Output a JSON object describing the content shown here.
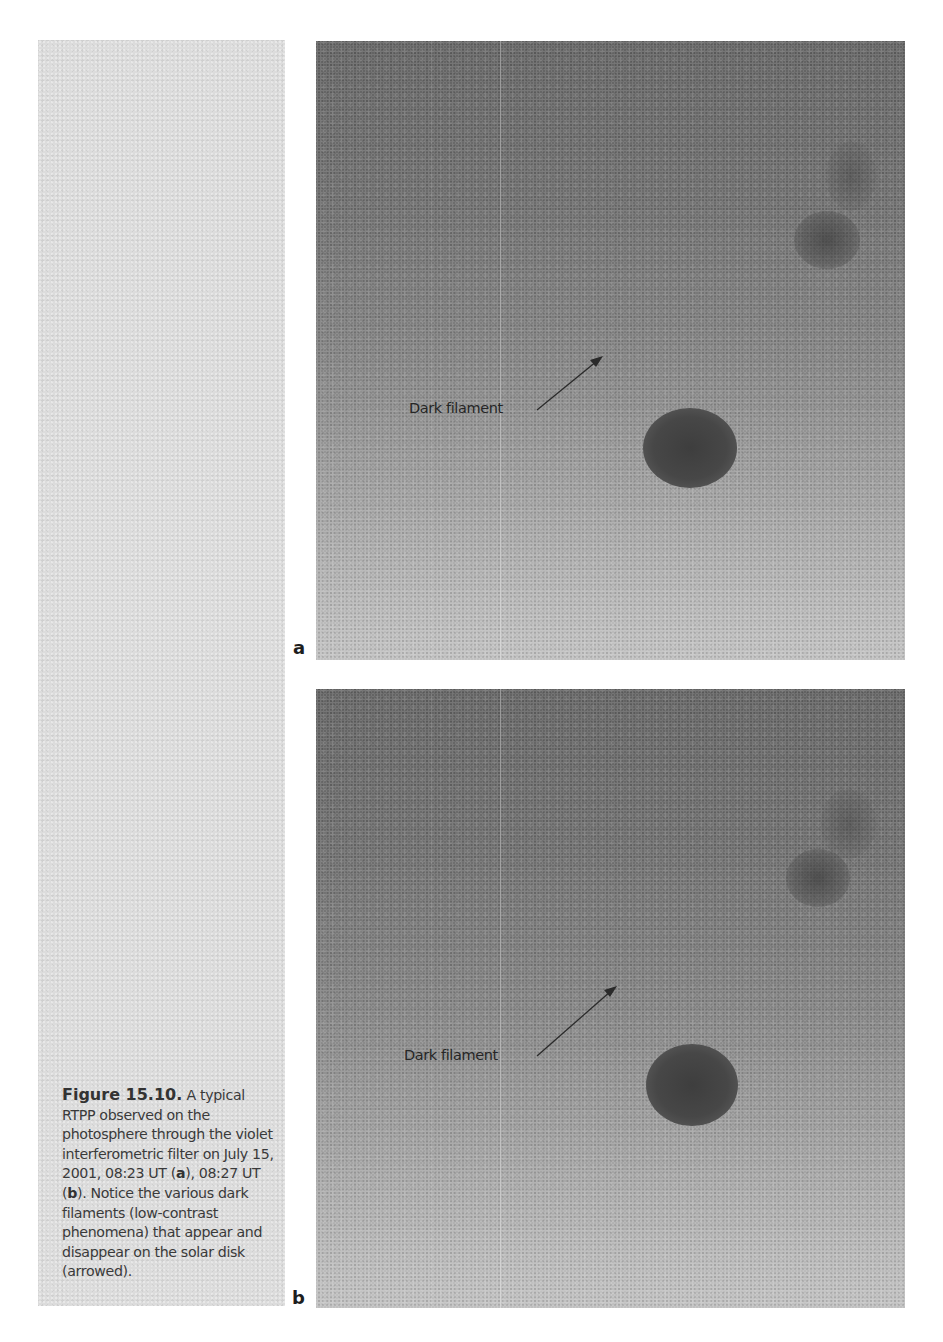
{
  "caption": {
    "figure_label": "Figure 15.10.",
    "lead": " A typical RTPP observed on the photosphere through the violet interferometric filter on July 15, 2001, 08:23 UT (",
    "panel_a_ref": "a",
    "mid": "), 08:27 UT (",
    "panel_b_ref": "b",
    "tail": "). Notice the various dark filaments (low-contrast phenomena) that appear and disappear on the solar disk (arrowed)."
  },
  "panels": [
    {
      "letter": "a",
      "time": "08:23 UT",
      "annotation": "Dark filament"
    },
    {
      "letter": "b",
      "time": "08:27 UT",
      "annotation": "Dark filament"
    }
  ],
  "colors": {
    "page_background": "#ffffff",
    "caption_panel": "#dcdcdc",
    "photo_top": "#606060",
    "photo_bottom": "#c0c0c0",
    "text": "#3a3a3a"
  }
}
